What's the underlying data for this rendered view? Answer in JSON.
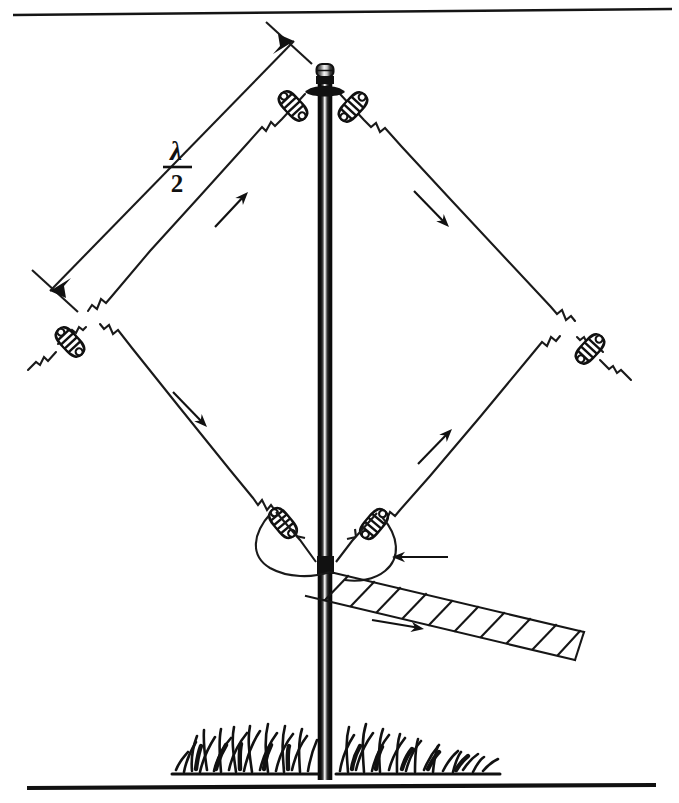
{
  "figure": {
    "title_visible": false,
    "background_color": "#ffffff",
    "ink_color": "#111111",
    "frame": {
      "top_rule": {
        "present": true,
        "thickness_px": 2,
        "x1": 12,
        "y1": 14,
        "x2": 672,
        "y2": 10
      },
      "bottom_rule": {
        "present": true,
        "thickness_px": 4,
        "x1": 26,
        "y1": 788,
        "x2": 656,
        "y2": 786
      }
    },
    "labels": {
      "leg_length_numerator": "λ",
      "leg_length_denominator": "2",
      "leg_length_full": "λ/2"
    },
    "geometry": {
      "apex": {
        "x": 322,
        "y": 74
      },
      "left_vertex": {
        "x": 95,
        "y": 318
      },
      "right_vertex": {
        "x": 567,
        "y": 328
      },
      "feed_point": {
        "x": 325,
        "y": 566
      },
      "mast_top_y": 66,
      "mast_base_y": 780,
      "mast_center_x": 325,
      "mast_width_px": 13
    },
    "components": {
      "mast": {
        "name": "vertical-support-mast",
        "style": "cylindrical-tube-shaded"
      },
      "mast_cap": {
        "name": "mast-cap",
        "shape": "rounded-cap"
      },
      "feed_insulator": {
        "name": "center-feed-insulator-block",
        "color": "#111111"
      },
      "egg_insulators": [
        {
          "id": 1,
          "position": "apex-left",
          "x": 292,
          "y": 104
        },
        {
          "id": 2,
          "position": "apex-right",
          "x": 352,
          "y": 104
        },
        {
          "id": 3,
          "position": "left-vertex-outer",
          "x": 70,
          "y": 342
        },
        {
          "id": 4,
          "position": "right-vertex-outer",
          "x": 587,
          "y": 348
        },
        {
          "id": 5,
          "position": "feed-left",
          "x": 282,
          "y": 523
        },
        {
          "id": 6,
          "position": "feed-right",
          "x": 375,
          "y": 524
        }
      ],
      "feedline": {
        "name": "ladder-line-feeder",
        "type": "open-wire-ladder-line",
        "rung_count": 10,
        "direction": "down-right"
      },
      "ground": {
        "name": "grass-tufts",
        "tuft_count": 26
      }
    },
    "current_arrows": [
      {
        "id": "upper-left-leg",
        "direction": "up-right",
        "meaning": "current toward apex"
      },
      {
        "id": "upper-right-leg",
        "direction": "down-right",
        "meaning": "current away from apex"
      },
      {
        "id": "lower-left-leg",
        "direction": "down-right",
        "meaning": "current toward feed"
      },
      {
        "id": "lower-right-leg",
        "direction": "up-right",
        "meaning": "current away from feed"
      },
      {
        "id": "feedline-inbound",
        "direction": "left",
        "meaning": "feedline current inbound"
      },
      {
        "id": "feedline-outbound",
        "direction": "right",
        "meaning": "feedline current outbound"
      }
    ],
    "dimension_line": {
      "name": "half-wavelength-dimension",
      "from": {
        "x": 48,
        "y": 290
      },
      "to": {
        "x": 298,
        "y": 38
      },
      "double_headed": true,
      "tick_marks": 2,
      "label": "λ/2"
    }
  }
}
